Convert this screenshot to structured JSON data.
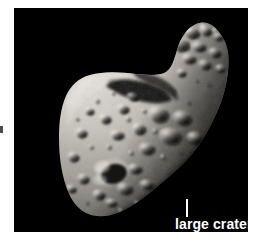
{
  "figure": {
    "background_color": "#ffffff",
    "panel_color": "#000000",
    "panel": {
      "x": 14,
      "y": 8,
      "width": 234,
      "height": 224
    }
  },
  "annotations": [
    {
      "id": "large-crater",
      "label": "large crater",
      "text_color": "#ffffff",
      "leader_line": {
        "x": 172,
        "y": 191,
        "length": 18,
        "orientation": "vertical"
      }
    }
  ],
  "image_features": {
    "body_name": "asteroid",
    "shape": "elongated peanut / saddle-shaped body",
    "lighting": "lit from upper left, terminator along lower right",
    "surface": "heavily cratered regolith, greyscale",
    "highlight_color": "#e8e6e2",
    "midtone_color": "#9a9790",
    "shadow_color": "#1a1a1a"
  }
}
